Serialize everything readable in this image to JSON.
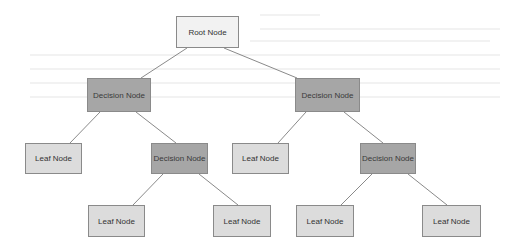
{
  "diagram": {
    "colors": {
      "root": "#f2f2f2",
      "decision": "#a6a6a6",
      "leaf": "#dcdcdc",
      "edge": "#8a8a8a"
    },
    "nodes": [
      {
        "id": "root",
        "type": "root",
        "label": "Root Node"
      },
      {
        "id": "d1",
        "type": "decision",
        "label": "Decision Node"
      },
      {
        "id": "d2",
        "type": "decision",
        "label": "Decision Node"
      },
      {
        "id": "l1",
        "type": "leaf",
        "label": "Leaf Node"
      },
      {
        "id": "d3",
        "type": "decision",
        "label": "Decision Node"
      },
      {
        "id": "l2",
        "type": "leaf",
        "label": "Leaf Node"
      },
      {
        "id": "d4",
        "type": "decision",
        "label": "Decision Node"
      },
      {
        "id": "l3",
        "type": "leaf",
        "label": "Leaf Node"
      },
      {
        "id": "l4",
        "type": "leaf",
        "label": "Leaf Node"
      },
      {
        "id": "l5",
        "type": "leaf",
        "label": "Leaf Node"
      },
      {
        "id": "l6",
        "type": "leaf",
        "label": "Leaf Node"
      }
    ],
    "edges": [
      [
        "root",
        "d1"
      ],
      [
        "root",
        "d2"
      ],
      [
        "d1",
        "l1"
      ],
      [
        "d1",
        "d3"
      ],
      [
        "d2",
        "l2"
      ],
      [
        "d2",
        "d4"
      ],
      [
        "d3",
        "l3"
      ],
      [
        "d3",
        "l4"
      ],
      [
        "d4",
        "l5"
      ],
      [
        "d4",
        "l6"
      ]
    ]
  }
}
